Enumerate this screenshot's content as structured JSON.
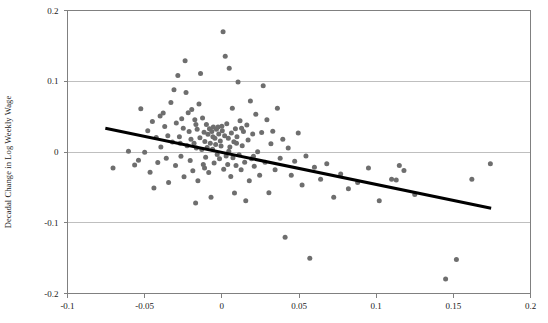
{
  "chart_data": {
    "type": "scatter",
    "title": "",
    "subtitle": "",
    "xlabel": "",
    "ylabel": "Decadal Change in Log Weekly Wage",
    "xlim": [
      -0.1,
      0.2
    ],
    "ylim": [
      -0.2,
      0.2
    ],
    "xticks": [
      "-0.1",
      "-0.05",
      "0",
      "0.05",
      "0.1",
      "0.15",
      "0.2"
    ],
    "xtick_values": [
      -0.1,
      -0.05,
      0,
      0.05,
      0.1,
      0.15,
      0.2
    ],
    "yticks": [
      "0.2",
      "0.1",
      "0",
      "-0.1",
      "-0.2"
    ],
    "ytick_values": [
      0.2,
      0.1,
      0,
      -0.1,
      -0.2
    ],
    "grid": "horizontal",
    "grid_color": "#bfbfbf",
    "legend": "none",
    "marker_color": "#6e6e6e",
    "marker_size_px": 5,
    "series": [
      {
        "name": "observations",
        "marker": "circle",
        "points": [
          [
            -0.0705,
            -0.0225
          ],
          [
            -0.0605,
            0.001
          ],
          [
            -0.0565,
            -0.0185
          ],
          [
            -0.054,
            -0.0115
          ],
          [
            -0.0525,
            0.061
          ],
          [
            -0.05,
            -0.0005
          ],
          [
            -0.048,
            0.03
          ],
          [
            -0.0465,
            -0.0285
          ],
          [
            -0.045,
            0.043
          ],
          [
            -0.044,
            -0.051
          ],
          [
            -0.0425,
            0.0205
          ],
          [
            -0.0415,
            -0.015
          ],
          [
            -0.04,
            0.051
          ],
          [
            -0.0395,
            0.007
          ],
          [
            -0.038,
            0.055
          ],
          [
            -0.037,
            0.036
          ],
          [
            -0.036,
            -0.009
          ],
          [
            -0.035,
            0.023
          ],
          [
            -0.0345,
            -0.043
          ],
          [
            -0.033,
            0.07
          ],
          [
            -0.032,
            0.014
          ],
          [
            -0.031,
            0.088
          ],
          [
            -0.03,
            -0.019
          ],
          [
            -0.0295,
            0.041
          ],
          [
            -0.0285,
            0.108
          ],
          [
            -0.0275,
            0.0215
          ],
          [
            -0.0265,
            -0.006
          ],
          [
            -0.026,
            0.047
          ],
          [
            -0.025,
            0.0335
          ],
          [
            -0.0245,
            -0.035
          ],
          [
            -0.0238,
            0.129
          ],
          [
            -0.0232,
            0.084
          ],
          [
            -0.0225,
            0.009
          ],
          [
            -0.0218,
            0.0555
          ],
          [
            -0.0212,
            0.029
          ],
          [
            -0.0205,
            -0.012
          ],
          [
            -0.02,
            0.018
          ],
          [
            -0.0195,
            0.06
          ],
          [
            -0.0188,
            -0.0265
          ],
          [
            -0.018,
            0.0125
          ],
          [
            -0.0175,
            0.0455
          ],
          [
            -0.017,
            -0.072
          ],
          [
            -0.0165,
            0.0055
          ],
          [
            -0.016,
            0.032
          ],
          [
            -0.0155,
            -0.0405
          ],
          [
            -0.0148,
            0.068
          ],
          [
            -0.0142,
            0.02
          ],
          [
            -0.0138,
            0.111
          ],
          [
            -0.013,
            0.0035
          ],
          [
            -0.0125,
            0.048
          ],
          [
            -0.012,
            -0.0175
          ],
          [
            -0.0115,
            0.028
          ],
          [
            -0.011,
            0.015
          ],
          [
            -0.0105,
            -0.0075
          ],
          [
            -0.01,
            0.039
          ],
          [
            -0.0095,
            0.0065
          ],
          [
            -0.009,
            0.025
          ],
          [
            -0.0085,
            -0.029
          ],
          [
            -0.008,
            0.033
          ],
          [
            -0.0075,
            0.0125
          ],
          [
            -0.007,
            -0.064
          ],
          [
            -0.0065,
            0.029
          ],
          [
            -0.006,
            0.004
          ],
          [
            -0.0055,
            0.0355
          ],
          [
            -0.005,
            -0.0155
          ],
          [
            -0.0045,
            0.0195
          ],
          [
            -0.004,
            0.0105
          ],
          [
            -0.0035,
            0.032
          ],
          [
            -0.003,
            -0.0035
          ],
          [
            -0.0025,
            0.0355
          ],
          [
            -0.002,
            0.0255
          ],
          [
            -0.0015,
            -0.0095
          ],
          [
            -0.001,
            0.0155
          ],
          [
            -0.0005,
            0.0085
          ],
          [
            0.0,
            0.0365
          ],
          [
            0.0003,
            0.03
          ],
          [
            0.0008,
            0.17
          ],
          [
            0.0012,
            -0.0245
          ],
          [
            0.0018,
            0.023
          ],
          [
            0.0022,
            0.1355
          ],
          [
            0.0028,
            -0.0055
          ],
          [
            0.0032,
            0.04
          ],
          [
            0.0038,
            -0.0175
          ],
          [
            0.0042,
            0.0195
          ],
          [
            0.0048,
            0.1185
          ],
          [
            0.0052,
            0.007
          ],
          [
            0.0058,
            -0.0345
          ],
          [
            0.0062,
            0.027
          ],
          [
            0.0068,
            0.062
          ],
          [
            0.0072,
            -0.008
          ],
          [
            0.0078,
            0.0145
          ],
          [
            0.0082,
            -0.058
          ],
          [
            0.0088,
            0.033
          ],
          [
            0.0092,
            -0.019
          ],
          [
            0.0098,
            0.0215
          ],
          [
            0.0105,
            0.099
          ],
          [
            0.0112,
            -0.004
          ],
          [
            0.0118,
            0.044
          ],
          [
            0.0125,
            -0.025
          ],
          [
            0.0132,
            0.009
          ],
          [
            0.014,
            0.029
          ],
          [
            0.0148,
            -0.0145
          ],
          [
            0.0155,
            -0.069
          ],
          [
            0.0162,
            0.038
          ],
          [
            0.017,
            0.017
          ],
          [
            0.0178,
            -0.0405
          ],
          [
            0.0185,
            0.072
          ],
          [
            0.0192,
            -0.0095
          ],
          [
            0.02,
            0.0255
          ],
          [
            0.021,
            -0.02
          ],
          [
            0.022,
            0.0535
          ],
          [
            0.0232,
            0.0005
          ],
          [
            0.0245,
            -0.033
          ],
          [
            0.0258,
            0.0275
          ],
          [
            0.0268,
            0.0935
          ],
          [
            0.028,
            -0.0145
          ],
          [
            0.0292,
            0.0455
          ],
          [
            0.0305,
            -0.0575
          ],
          [
            0.0318,
            0.0115
          ],
          [
            0.033,
            0.0295
          ],
          [
            0.0345,
            -0.025
          ],
          [
            0.036,
            0.062
          ],
          [
            0.0378,
            -0.009
          ],
          [
            0.0395,
            0.018
          ],
          [
            0.041,
            -0.1205
          ],
          [
            0.043,
            0.0055
          ],
          [
            0.045,
            -0.033
          ],
          [
            0.0472,
            -0.013
          ],
          [
            0.0495,
            0.027
          ],
          [
            0.052,
            -0.0465
          ],
          [
            0.0545,
            -0.0055
          ],
          [
            0.057,
            -0.15
          ],
          [
            0.06,
            -0.0215
          ],
          [
            0.064,
            -0.0385
          ],
          [
            0.068,
            -0.0165
          ],
          [
            0.0725,
            -0.064
          ],
          [
            0.077,
            -0.031
          ],
          [
            0.082,
            -0.052
          ],
          [
            0.088,
            -0.043
          ],
          [
            0.095,
            -0.0225
          ],
          [
            0.102,
            -0.069
          ],
          [
            0.11,
            -0.0385
          ],
          [
            0.113,
            -0.0395
          ],
          [
            0.115,
            -0.019
          ],
          [
            0.118,
            -0.026
          ],
          [
            0.125,
            -0.06
          ],
          [
            0.145,
            -0.1795
          ],
          [
            0.152,
            -0.152
          ],
          [
            0.162,
            -0.0385
          ],
          [
            0.174,
            -0.0165
          ],
          [
            0.0095,
            0.0125
          ],
          [
            0.0045,
            0.001
          ],
          [
            -0.0058,
            0.0215
          ],
          [
            -0.0112,
            -0.0225
          ],
          [
            -0.0168,
            0.039
          ],
          [
            0.0128,
            0.0335
          ],
          [
            0.0205,
            -0.006
          ],
          [
            -0.027,
            0.0125
          ]
        ]
      }
    ],
    "trendline": {
      "label": "fitted regression line",
      "color": "#000000",
      "width_px": 3,
      "x_start": -0.0755,
      "y_start": 0.0335,
      "x_end": 0.1745,
      "y_end": -0.0795
    }
  },
  "axis": {
    "axis_color": "#808080",
    "tick_color": "#808080"
  }
}
